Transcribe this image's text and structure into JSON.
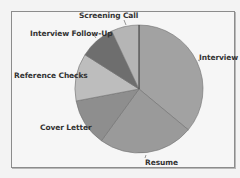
{
  "chart_data": {
    "type": "pie",
    "title": "",
    "categories": [
      "Interview",
      "Resume",
      "Cover Letter",
      "Reference Checks",
      "Interview Follow-Up",
      "Screening Call"
    ],
    "values": [
      36,
      24,
      12,
      12,
      9,
      7
    ],
    "unit": "percent (estimated from slice angles)",
    "start_angle_deg": 0,
    "direction": "clockwise",
    "colors": [
      "#a2a2a2",
      "#9a9a9a",
      "#8e8e8e",
      "#bdbdbd",
      "#6e6e6e",
      "#b5b5b5"
    ],
    "legend": "none (labels placed beside slices with leader lines)"
  },
  "labels": {
    "interview": "Interview",
    "resume": "Resume",
    "cover_letter": "Cover Letter",
    "reference_checks": "Reference Checks",
    "interview_follow_up": "Interview Follow-Up",
    "screening_call": "Screening Call"
  }
}
